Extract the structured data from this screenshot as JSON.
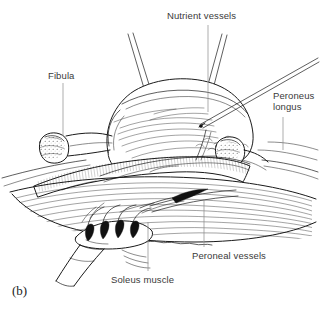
{
  "figure": {
    "caption": "(b)",
    "background_color": "#ffffff",
    "ink_color": "#1a1a1a",
    "leader_color": "#8a8a8a",
    "label_color": "#3a3a3a",
    "width": 320,
    "height": 309
  },
  "labels": [
    {
      "id": "nutrient-vessels",
      "text": "Nutrient vessels",
      "x": 167,
      "y": 10,
      "leader": {
        "x1": 208,
        "y1": 25,
        "x2": 208,
        "y2": 112
      }
    },
    {
      "id": "fibula",
      "text": "Fibula",
      "x": 48,
      "y": 70,
      "leader": {
        "x1": 63,
        "y1": 83,
        "x2": 63,
        "y2": 136
      }
    },
    {
      "id": "peroneus-longus",
      "text": "Peroneus\nlongus",
      "x": 273,
      "y": 90,
      "leader": {
        "x1": 283,
        "y1": 117,
        "x2": 283,
        "y2": 150
      }
    },
    {
      "id": "peroneal-vessels",
      "text": "Peroneal vessels",
      "x": 192,
      "y": 250,
      "leader": {
        "x1": 204,
        "y1": 200,
        "x2": 204,
        "y2": 247
      }
    },
    {
      "id": "soleus-muscle",
      "text": "Soleus muscle",
      "x": 111,
      "y": 274,
      "leader": {
        "x1": 148,
        "y1": 222,
        "x2": 148,
        "y2": 271
      }
    }
  ],
  "structures": [
    {
      "id": "flap-mass",
      "name": "retracted-muscle-flap"
    },
    {
      "id": "fibula-left-cut",
      "name": "fibula-proximal-cut-end"
    },
    {
      "id": "fibula-right-cut",
      "name": "fibula-distal-cut-end"
    },
    {
      "id": "vascular-pedicle",
      "name": "peroneal-vascular-pedicle"
    },
    {
      "id": "soleus-belly",
      "name": "soleus-muscle-belly"
    },
    {
      "id": "rake-retractor",
      "name": "four-prong-rake-retractor"
    },
    {
      "id": "probe",
      "name": "fine-dissecting-probe"
    },
    {
      "id": "suture-left",
      "name": "traction-suture-left"
    },
    {
      "id": "suture-right",
      "name": "traction-suture-right"
    }
  ]
}
